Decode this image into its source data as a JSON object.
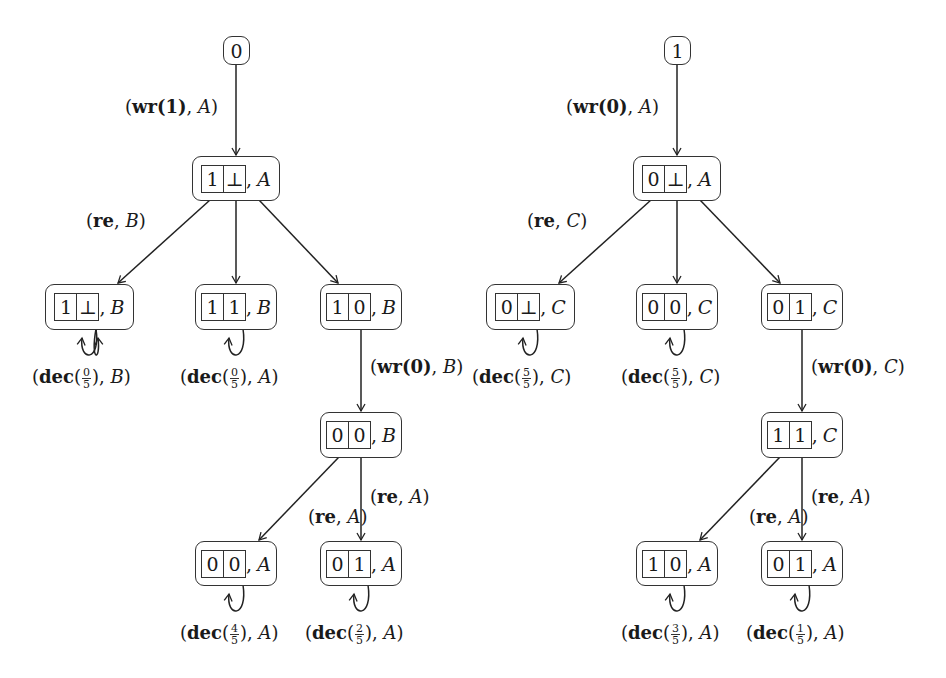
{
  "diagram": {
    "left_tree": {
      "root": {
        "label": "0"
      },
      "edges": {
        "root_to_n1": "wr(1)",
        "root_to_n1_agent": "A",
        "n1_to_left": "re",
        "n1_to_left_agent": "B",
        "n10B_to_n00B": "wr(0)",
        "n10B_to_n00B_agent": "B",
        "n00B_to_n01A": "re",
        "n00B_to_n01A_agent": "A",
        "n00B_to_n01A_overlap": "re",
        "n00B_to_n01A_overlap_agent": "A"
      },
      "nodes": {
        "n1": {
          "c1": "1",
          "c2": "⊥",
          "agent": "A"
        },
        "n2a": {
          "c1": "1",
          "c2": "⊥",
          "agent": "B"
        },
        "n2b": {
          "c1": "1",
          "c2": "1",
          "agent": "B"
        },
        "n2c": {
          "c1": "1",
          "c2": "0",
          "agent": "B"
        },
        "n3": {
          "c1": "0",
          "c2": "0",
          "agent": "B"
        },
        "n4a": {
          "c1": "0",
          "c2": "0",
          "agent": "A"
        },
        "n4b": {
          "c1": "0",
          "c2": "1",
          "agent": "A"
        }
      },
      "loops": {
        "n2a": {
          "action": "dec",
          "num": "0",
          "den": "5",
          "agent": "B"
        },
        "n2b": {
          "action": "dec",
          "num": "0",
          "den": "5",
          "agent": "A"
        },
        "n4a": {
          "action": "dec",
          "num": "4",
          "den": "5",
          "agent": "A"
        },
        "n4b": {
          "action": "dec",
          "num": "2",
          "den": "5",
          "agent": "A"
        }
      }
    },
    "right_tree": {
      "root": {
        "label": "1"
      },
      "edges": {
        "root_to_n1": "wr(0)",
        "root_to_n1_agent": "A",
        "n1_to_left": "re",
        "n1_to_left_agent": "C",
        "n01C_to_n11C": "wr(0)",
        "n01C_to_n11C_agent": "C",
        "n11C_to_n01A": "re",
        "n11C_to_n01A_agent": "A",
        "n11C_to_n01A_overlap": "re",
        "n11C_to_n01A_overlap_agent": "A"
      },
      "nodes": {
        "n1": {
          "c1": "0",
          "c2": "⊥",
          "agent": "A"
        },
        "n2a": {
          "c1": "0",
          "c2": "⊥",
          "agent": "C"
        },
        "n2b": {
          "c1": "0",
          "c2": "0",
          "agent": "C"
        },
        "n2c": {
          "c1": "0",
          "c2": "1",
          "agent": "C"
        },
        "n3": {
          "c1": "1",
          "c2": "1",
          "agent": "C"
        },
        "n4a": {
          "c1": "1",
          "c2": "0",
          "agent": "A"
        },
        "n4b": {
          "c1": "0",
          "c2": "1",
          "agent": "A"
        }
      },
      "loops": {
        "n2a": {
          "action": "dec",
          "num": "5",
          "den": "5",
          "agent": "C"
        },
        "n2b": {
          "action": "dec",
          "num": "5",
          "den": "5",
          "agent": "C"
        },
        "n4a": {
          "action": "dec",
          "num": "3",
          "den": "5",
          "agent": "A"
        },
        "n4b": {
          "action": "dec",
          "num": "1",
          "den": "5",
          "agent": "A"
        }
      }
    }
  }
}
